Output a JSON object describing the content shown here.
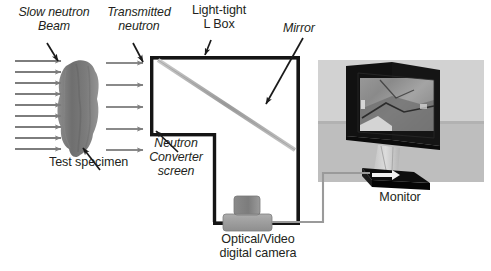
{
  "figure": {
    "kind": "neutron-radiography-setup-diagram",
    "background_color": "#ffffff",
    "line_color": "#1a1a1a",
    "arrow_gray": "#7d7d7d",
    "mirror_gray": "#a8a8a8",
    "specimen_gray": "#7b7b7b",
    "camera_gray": "#9a9a9a",
    "photo_panel_gray": "#d2d2d2",
    "photo_floor_gray": "#bdbdbd"
  },
  "labels": {
    "slow_neutron_beam": "Slow neutron\nBeam",
    "transmitted_neutron": "Transmitted\nneutron",
    "light_tight_l_box": "Light-tight\nL Box",
    "mirror": "Mirror",
    "test_specimen": "Test specimen",
    "neutron_converter_screen": "Neutron\nConverter\nscreen",
    "optical_video_digital_camera": "Optical/Video\ndigital camera",
    "monitor": "Monitor"
  },
  "components": {
    "incident_beam_arrow_count": 9,
    "transmitted_beam_arrow_count": 5,
    "l_box": "light-tight L-shaped enclosure",
    "mirror_orientation": "45-degree diagonal",
    "converter_screen_position": "left wall interior of L box",
    "camera_position": "bottom of L box vertical arm",
    "cable": "camera-to-monitor signal cable"
  },
  "icon_names": {
    "pointer_arrow": "pointer-arrow-icon",
    "beam_arrow": "beam-arrow-icon",
    "mirror_strip": "mirror-strip-icon",
    "specimen_blob": "test-specimen-icon",
    "camera_body": "camera-icon",
    "monitor_photo": "monitor-photo-icon",
    "cable_line": "cable-icon"
  }
}
